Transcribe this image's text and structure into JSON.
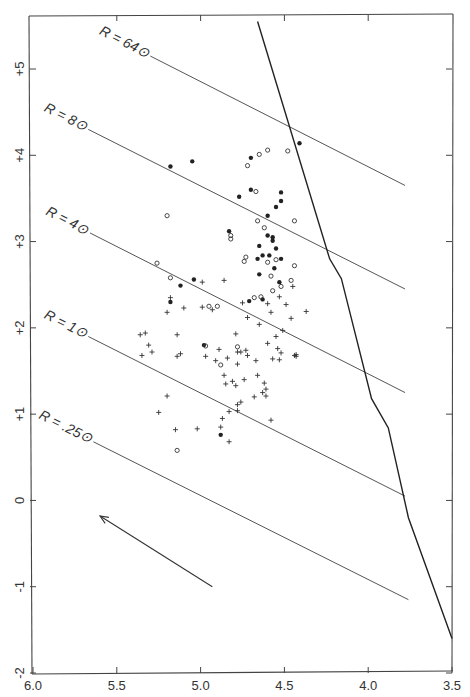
{
  "chart_data": {
    "type": "scatter",
    "title": "",
    "xlabel": "",
    "ylabel": "",
    "xlim": [
      6.0,
      3.5
    ],
    "ylim": [
      -2,
      5.55
    ],
    "x_reversed": true,
    "grid": false,
    "x_ticks": [
      6.0,
      5.5,
      5.0,
      4.5,
      4.0,
      3.5
    ],
    "x_tick_labels": [
      "6.0",
      "5.5",
      "5.0",
      "4.5",
      "4.0",
      "3.5"
    ],
    "y_ticks": [
      5,
      4,
      3,
      2,
      1,
      0,
      -1,
      -2
    ],
    "y_tick_labels": [
      "+5",
      "+4",
      "+3",
      "+2",
      "+1",
      "0",
      "-1",
      "-2"
    ],
    "radius_lines": [
      {
        "label": "R = 64⊙",
        "x": [
          5.3,
          3.78
        ],
        "y": [
          5.15,
          3.65
        ]
      },
      {
        "label": "R = 8⊙",
        "x": [
          5.67,
          3.78
        ],
        "y": [
          4.3,
          2.45
        ]
      },
      {
        "label": "R = 4⊙",
        "x": [
          5.66,
          3.78
        ],
        "y": [
          3.1,
          1.25
        ]
      },
      {
        "label": "R = 1⊙",
        "x": [
          5.67,
          3.78
        ],
        "y": [
          1.9,
          0.05
        ]
      },
      {
        "label": "R = .25⊙",
        "x": [
          5.64,
          3.76
        ],
        "y": [
          0.68,
          -1.15
        ]
      }
    ],
    "boundary_curve": {
      "x": [
        4.66,
        4.23,
        4.16,
        3.98,
        3.88,
        3.76,
        3.5
      ],
      "y": [
        5.55,
        2.8,
        2.57,
        1.18,
        0.84,
        -0.2,
        -1.6
      ]
    },
    "arrow": {
      "from": [
        4.93,
        -1.0
      ],
      "to": [
        5.6,
        -0.18
      ]
    },
    "series": [
      {
        "name": "filled circles",
        "marker": "filled-circle",
        "points": [
          [
            4.41,
            4.14
          ],
          [
            5.18,
            3.87
          ],
          [
            5.05,
            3.93
          ],
          [
            4.7,
            3.97
          ],
          [
            4.83,
            3.12
          ],
          [
            4.57,
            3.01
          ],
          [
            4.77,
            3.52
          ],
          [
            4.7,
            3.6
          ],
          [
            4.52,
            3.57
          ],
          [
            4.52,
            3.47
          ],
          [
            4.6,
            3.3
          ],
          [
            4.65,
            2.95
          ],
          [
            4.55,
            2.92
          ],
          [
            4.66,
            2.8
          ],
          [
            4.59,
            2.84
          ],
          [
            4.52,
            2.8
          ],
          [
            4.65,
            2.62
          ],
          [
            4.56,
            2.69
          ],
          [
            4.53,
            2.53
          ],
          [
            4.71,
            2.31
          ],
          [
            4.63,
            2.33
          ],
          [
            5.04,
            2.56
          ],
          [
            5.12,
            2.49
          ],
          [
            5.18,
            2.3
          ],
          [
            4.63,
            2.84
          ],
          [
            4.6,
            3.07
          ],
          [
            4.57,
            3.05
          ],
          [
            4.88,
            0.76
          ],
          [
            4.98,
            1.8
          ],
          [
            4.55,
            3.4
          ]
        ]
      },
      {
        "name": "open circles",
        "marker": "open-circle",
        "points": [
          [
            5.2,
            3.3
          ],
          [
            5.26,
            2.75
          ],
          [
            5.18,
            2.58
          ],
          [
            4.95,
            2.25
          ],
          [
            4.97,
            1.79
          ],
          [
            4.78,
            1.78
          ],
          [
            4.88,
            1.57
          ],
          [
            5.14,
            0.58
          ],
          [
            4.65,
            4.01
          ],
          [
            4.6,
            4.06
          ],
          [
            4.48,
            4.05
          ],
          [
            4.72,
            3.88
          ],
          [
            4.67,
            3.58
          ],
          [
            4.44,
            3.24
          ],
          [
            4.66,
            3.24
          ],
          [
            4.62,
            3.16
          ],
          [
            4.82,
            3.07
          ],
          [
            4.82,
            3.03
          ],
          [
            4.73,
            2.82
          ],
          [
            4.74,
            2.77
          ],
          [
            4.6,
            2.76
          ],
          [
            4.55,
            2.79
          ],
          [
            4.44,
            2.72
          ],
          [
            4.58,
            2.6
          ],
          [
            4.46,
            2.55
          ],
          [
            4.52,
            2.48
          ],
          [
            4.57,
            2.43
          ],
          [
            4.64,
            2.36
          ],
          [
            4.68,
            2.35
          ],
          [
            4.9,
            2.25
          ]
        ]
      },
      {
        "name": "crosses",
        "marker": "plus",
        "points": [
          [
            5.36,
            1.92
          ],
          [
            5.33,
            1.94
          ],
          [
            5.31,
            1.8
          ],
          [
            5.35,
            1.68
          ],
          [
            5.29,
            1.72
          ],
          [
            5.14,
            1.92
          ],
          [
            5.12,
            1.7
          ],
          [
            5.2,
            2.18
          ],
          [
            5.18,
            2.35
          ],
          [
            5.1,
            2.23
          ],
          [
            4.99,
            2.24
          ],
          [
            4.93,
            2.21
          ],
          [
            4.89,
            1.75
          ],
          [
            4.84,
            1.65
          ],
          [
            4.78,
            1.72
          ],
          [
            4.76,
            1.72
          ],
          [
            4.79,
            1.93
          ],
          [
            4.72,
            1.68
          ],
          [
            4.86,
            1.45
          ],
          [
            4.81,
            1.38
          ],
          [
            4.79,
            1.33
          ],
          [
            4.85,
            1.35
          ],
          [
            4.67,
            1.62
          ],
          [
            4.66,
            1.45
          ],
          [
            4.62,
            1.36
          ],
          [
            4.57,
            1.64
          ],
          [
            4.6,
            1.82
          ],
          [
            4.55,
            1.9
          ],
          [
            4.54,
            1.76
          ],
          [
            4.52,
            1.71
          ],
          [
            4.53,
            1.63
          ],
          [
            4.44,
            1.68
          ],
          [
            4.43,
            1.67
          ],
          [
            4.61,
            1.29
          ],
          [
            4.61,
            1.21
          ],
          [
            4.63,
            1.25
          ],
          [
            4.68,
            1.2
          ],
          [
            4.76,
            1.14
          ],
          [
            4.78,
            1.11
          ],
          [
            4.78,
            1.04
          ],
          [
            4.83,
            1.03
          ],
          [
            4.87,
            0.95
          ],
          [
            4.88,
            0.85
          ],
          [
            4.83,
            0.68
          ],
          [
            5.02,
            0.83
          ],
          [
            5.15,
            0.82
          ],
          [
            5.25,
            1.02
          ],
          [
            5.2,
            1.21
          ],
          [
            4.58,
            0.93
          ],
          [
            4.46,
            2.11
          ],
          [
            4.51,
            1.97
          ],
          [
            4.53,
            2.36
          ],
          [
            4.58,
            2.18
          ],
          [
            4.49,
            2.27
          ],
          [
            4.45,
            2.48
          ],
          [
            4.37,
            2.19
          ],
          [
            4.6,
            2.28
          ],
          [
            4.75,
            2.29
          ],
          [
            4.78,
            1.58
          ],
          [
            4.91,
            1.62
          ],
          [
            4.97,
            1.67
          ],
          [
            4.86,
            2.55
          ],
          [
            4.99,
            2.53
          ],
          [
            5.14,
            1.67
          ],
          [
            4.72,
            2.12
          ],
          [
            4.65,
            2.04
          ],
          [
            4.43,
            1.69
          ],
          [
            4.73,
            1.74
          ],
          [
            4.74,
            1.4
          ]
        ]
      }
    ]
  }
}
